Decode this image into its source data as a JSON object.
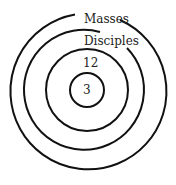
{
  "diagram": {
    "type": "concentric-circles",
    "rings": [
      {
        "label": "3",
        "order": 1
      },
      {
        "label": "12",
        "order": 2
      },
      {
        "label": "Disciples",
        "order": 3
      },
      {
        "label": "Masses",
        "order": 4
      }
    ],
    "labels": {
      "inner": "3",
      "second": "12",
      "third": "Disciples",
      "outer": "Masses"
    },
    "stroke_color": "#111111"
  }
}
